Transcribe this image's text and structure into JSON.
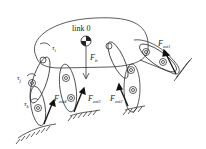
{
  "diagram": {
    "title": "link 0",
    "body_label": "link 0",
    "labels": {
      "tau_i": {
        "base": "τ",
        "sub": "i"
      },
      "tau_j": {
        "base": "τ",
        "sub": "j"
      },
      "tau_k": {
        "base": "τ",
        "sub": "k"
      },
      "F_b": {
        "base": "F",
        "sub": "b"
      },
      "F_ext1": {
        "base": "F",
        "sub": "ext1"
      },
      "F_ext2": {
        "base": "F",
        "sub": "ext2"
      },
      "F_ext3": {
        "base": "F",
        "sub": "ext3"
      },
      "F_ext4": {
        "base": "F",
        "sub": "ext4"
      }
    },
    "colors": {
      "stroke": "#333333",
      "background": "#ffffff"
    }
  }
}
